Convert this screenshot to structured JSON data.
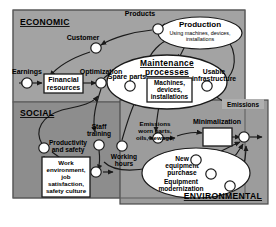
{
  "diagram": {
    "colors": {
      "economic_panel": "#a3a3a3",
      "social_panel": "#8f8f8f",
      "environmental_panel": "#9a9a9a",
      "ellipse_fill": "#ffffff",
      "box_fill": "#ffffff",
      "node_fill": "#ffffff",
      "stroke": "#1a1a1a",
      "outer_border": "#6b6b6b",
      "page_background": "#ffffff"
    },
    "sections": [
      {
        "id": "economic",
        "label": "ECONOMIC"
      },
      {
        "id": "social",
        "label": "SOCIAL"
      },
      {
        "id": "environmental",
        "label": "ENVIRONMENTAL"
      }
    ],
    "ellipses": [
      {
        "id": "production",
        "line1": "Production",
        "line2": "Using machines, devices,",
        "line3": "installations"
      },
      {
        "id": "maintenance",
        "line1": "Maintenance",
        "line2": "processes"
      },
      {
        "id": "environmental_actions",
        "line1": "New",
        "line2": "equipment",
        "line3": "purchase",
        "line4": "Equipment",
        "line5": "modernization"
      }
    ],
    "boxes": [
      {
        "id": "financial-resources",
        "line1": "Financial",
        "line2": "resources"
      },
      {
        "id": "machines-devices-installations",
        "line1": "Machines,",
        "line2": "devices,",
        "line3": "installations"
      },
      {
        "id": "work-environment",
        "line1": "Work",
        "line2": "environment,",
        "line3": "job",
        "line4": "satisfaction,",
        "line5": "safety culture"
      },
      {
        "id": "minimalization-box",
        "line1": ""
      }
    ],
    "node_labels": [
      {
        "id": "products",
        "text": "Products"
      },
      {
        "id": "customer",
        "text": "Customer"
      },
      {
        "id": "earnings",
        "text": "Earnings"
      },
      {
        "id": "optimization",
        "text": "Optimization"
      },
      {
        "id": "spare-parts",
        "text": "Spare parts"
      },
      {
        "id": "usable-infrastructure",
        "line1": "Usable",
        "line2": "infrastructure"
      },
      {
        "id": "emissions-tag",
        "text": "Emissions"
      },
      {
        "id": "minimalization",
        "text": "Minimalization"
      },
      {
        "id": "emissions-worn-parts",
        "line1": "Emissions",
        "line2": "worn parts,",
        "line3": "oils, sewage,"
      },
      {
        "id": "productivity-and-safety",
        "line1": "Productivity",
        "line2": "and safety"
      },
      {
        "id": "staff-training",
        "line1": "Staff",
        "line2": "training"
      },
      {
        "id": "working-hours",
        "line1": "Working",
        "line2": "hours"
      }
    ]
  }
}
